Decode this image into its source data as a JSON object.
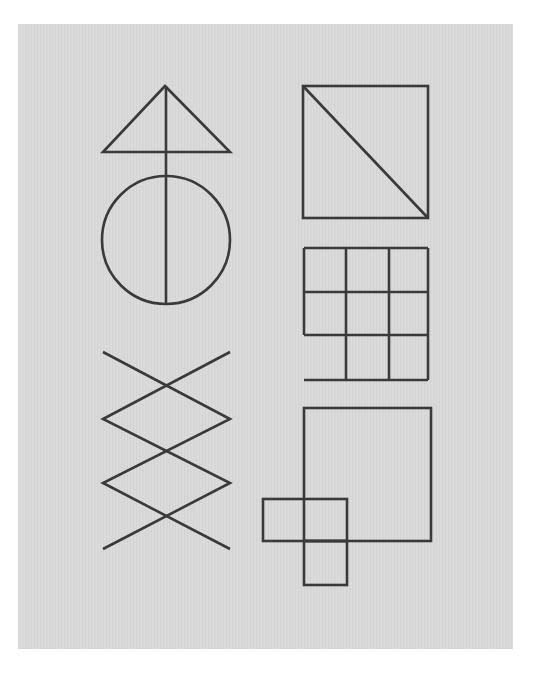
{
  "page": {
    "background": "#ffffff",
    "panel_color": "#d9d9d9",
    "stroke_color": "#3a3a3a"
  },
  "figures": [
    {
      "id": "triangle-over-circle",
      "description": "Triangle atop a circle, bisected by a vertical line",
      "triangle": {
        "apex": [
          165,
          86
        ],
        "base_left": [
          103,
          152
        ],
        "base_right": [
          230,
          152
        ]
      },
      "circle": {
        "cx": 166,
        "cy": 240,
        "r": 64
      },
      "vertical_line": {
        "x": 166,
        "y1": 86,
        "y2": 305
      }
    },
    {
      "id": "square-with-diagonal",
      "description": "Square with diagonal from top-left to bottom-right",
      "square": {
        "x": 303,
        "y": 86,
        "w": 125,
        "h": 132
      },
      "diagonal": {
        "from": [
          303,
          86
        ],
        "to": [
          428,
          218
        ]
      }
    },
    {
      "id": "grid-3x3-open-corner",
      "description": "3x3 grid missing left edge of bottom-left cell",
      "columns_x": [
        304,
        346,
        389,
        428
      ],
      "rows_y": [
        248,
        292,
        335,
        380
      ]
    },
    {
      "id": "zigzag-lattice",
      "description": "Two interlaced zigzag lines forming stacked diamonds",
      "line_a": [
        [
          103,
          352
        ],
        [
          230,
          419
        ],
        [
          103,
          483
        ],
        [
          230,
          549
        ]
      ],
      "line_b": [
        [
          230,
          352
        ],
        [
          103,
          419
        ],
        [
          230,
          483
        ],
        [
          103,
          549
        ]
      ]
    },
    {
      "id": "square-with-cross-blocks",
      "description": "Large square with two small adjoining rectangles at lower-left",
      "big_square": {
        "x": 304,
        "y": 408,
        "w": 127,
        "h": 133
      },
      "left_block": {
        "x": 263,
        "y": 499,
        "w": 84,
        "h": 42
      },
      "lower_block": {
        "x": 304,
        "y": 541,
        "w": 43,
        "h": 44
      }
    }
  ]
}
